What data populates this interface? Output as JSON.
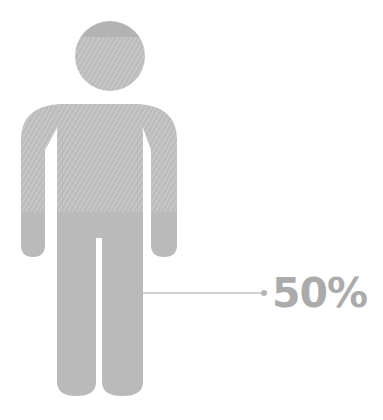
{
  "infographic": {
    "type": "person-fill-gauge",
    "value_label": "50%",
    "value": 50,
    "colors": {
      "figure_fill": "#bababa",
      "figure_top_solid": "#b0b0b0",
      "hatch_line": "#d6d6d6",
      "connector": "#c4c4c4",
      "label": "#ababab"
    }
  }
}
